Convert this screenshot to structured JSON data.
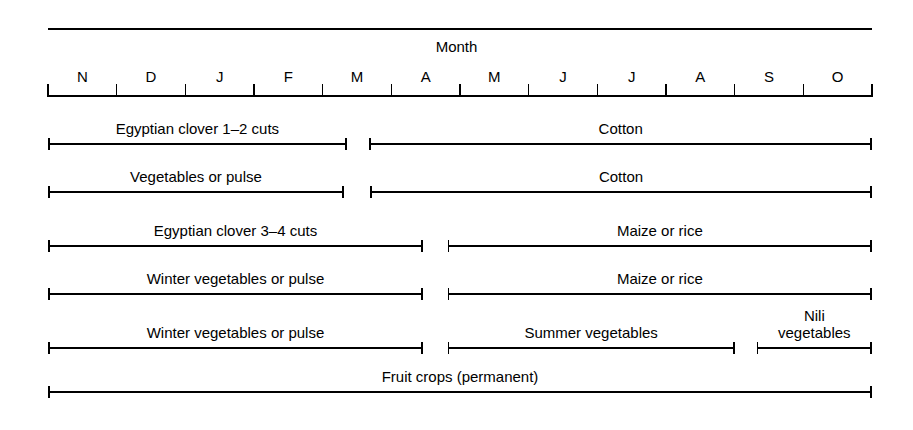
{
  "chart_data": {
    "type": "table",
    "title": "Month",
    "xlabel": "Month",
    "ylabel": "",
    "grid": false,
    "legend": "none",
    "axis": {
      "start_px": 48,
      "end_px": 872,
      "tick_count": 13,
      "tick_labels": [
        "N",
        "D",
        "J",
        "F",
        "M",
        "A",
        "M",
        "J",
        "J",
        "A",
        "S",
        "O"
      ],
      "tick_label_meaning": [
        "November",
        "December",
        "January",
        "February",
        "March",
        "April",
        "May",
        "June",
        "July",
        "August",
        "September",
        "October"
      ]
    },
    "rotations": [
      {
        "row": 1,
        "segments": [
          {
            "label": "Egyptian clover 1–2 cuts",
            "start_month_index": 0,
            "end_month_index": 4.35
          },
          {
            "label": "Cotton",
            "start_month_index": 4.68,
            "end_month_index": 12
          }
        ]
      },
      {
        "row": 2,
        "segments": [
          {
            "label": "Vegetables or pulse",
            "start_month_index": 0,
            "end_month_index": 4.31
          },
          {
            "label": "Cotton",
            "start_month_index": 4.69,
            "end_month_index": 12
          }
        ]
      },
      {
        "row": 3,
        "segments": [
          {
            "label": "Egyptian clover 3–4 cuts",
            "start_month_index": 0,
            "end_month_index": 5.46
          },
          {
            "label": "Maize or rice",
            "start_month_index": 5.82,
            "end_month_index": 12
          }
        ]
      },
      {
        "row": 4,
        "segments": [
          {
            "label": "Winter vegetables or pulse",
            "start_month_index": 0,
            "end_month_index": 5.46
          },
          {
            "label": "Maize or rice",
            "start_month_index": 5.82,
            "end_month_index": 12
          }
        ]
      },
      {
        "row": 5,
        "segments": [
          {
            "label": "Winter vegetables or pulse",
            "start_month_index": 0,
            "end_month_index": 5.46
          },
          {
            "label": "Summer vegetables",
            "start_month_index": 5.82,
            "end_month_index": 10.0
          },
          {
            "label": "Nili\nvegetables",
            "start_month_index": 10.32,
            "end_month_index": 12
          }
        ]
      },
      {
        "row": 6,
        "segments": [
          {
            "label": "Fruit crops (permanent)",
            "start_month_index": 0,
            "end_month_index": 12
          }
        ]
      }
    ]
  },
  "colors": {
    "ink": "#000000",
    "background": "#ffffff"
  }
}
